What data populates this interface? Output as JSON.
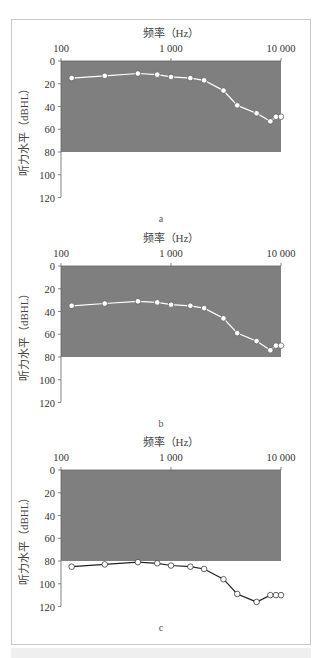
{
  "chart_data": [
    {
      "panel": "a",
      "type": "line",
      "title": "",
      "xlabel": "频率（Hz）",
      "ylabel": "听力水平（dBHL）",
      "x_scale": "log",
      "x_axis_position": "top",
      "xlim": [
        100,
        10000
      ],
      "ylim": [
        0,
        120
      ],
      "y_inverted": true,
      "x_ticks": [
        "100",
        "1 000",
        "10 000"
      ],
      "y_ticks": [
        "0",
        "20",
        "40",
        "60",
        "80",
        "100",
        "120"
      ],
      "shaded_region": {
        "y_from": 0,
        "y_to": 80,
        "color": "#7f7f7f"
      },
      "line_color": "#ffffff",
      "marker": "open-circle",
      "grid": false,
      "legend": null,
      "x": [
        125,
        250,
        500,
        750,
        1000,
        1500,
        2000,
        3000,
        4000,
        6000,
        8000,
        9000,
        10000
      ],
      "values": [
        15,
        13,
        11,
        12,
        14,
        15,
        17,
        26,
        39,
        46,
        53,
        49,
        49
      ]
    },
    {
      "panel": "b",
      "type": "line",
      "title": "",
      "xlabel": "频率（Hz）",
      "ylabel": "听力水平（dBHL）",
      "x_scale": "log",
      "x_axis_position": "top",
      "xlim": [
        100,
        10000
      ],
      "ylim": [
        0,
        120
      ],
      "y_inverted": true,
      "x_ticks": [
        "100",
        "1 000",
        "10 000"
      ],
      "y_ticks": [
        "0",
        "20",
        "40",
        "60",
        "80",
        "100",
        "120"
      ],
      "shaded_region": {
        "y_from": 0,
        "y_to": 80,
        "color": "#7f7f7f"
      },
      "line_color": "#ffffff",
      "marker": "open-circle",
      "grid": false,
      "legend": null,
      "x": [
        125,
        250,
        500,
        750,
        1000,
        1500,
        2000,
        3000,
        4000,
        6000,
        8000,
        9000,
        10000
      ],
      "values": [
        35,
        33,
        31,
        32,
        34,
        35,
        37,
        46,
        59,
        66,
        74,
        70,
        70
      ]
    },
    {
      "panel": "c",
      "type": "line",
      "title": "",
      "xlabel": "频率（Hz）",
      "ylabel": "听力水平（dBHL）",
      "x_scale": "log",
      "x_axis_position": "top",
      "xlim": [
        100,
        10000
      ],
      "ylim": [
        0,
        120
      ],
      "y_inverted": true,
      "x_ticks": [
        "100",
        "1 000",
        "10 000"
      ],
      "y_ticks": [
        "0",
        "20",
        "40",
        "60",
        "80",
        "100",
        "120"
      ],
      "shaded_region": {
        "y_from": 0,
        "y_to": 80,
        "color": "#7f7f7f"
      },
      "line_color": "#222222",
      "marker": "open-circle",
      "grid": false,
      "legend": null,
      "x": [
        125,
        250,
        500,
        750,
        1000,
        1500,
        2000,
        3000,
        4000,
        6000,
        8000,
        9000,
        10000
      ],
      "values": [
        85,
        83,
        81,
        82,
        84,
        85,
        87,
        96,
        109,
        116,
        110,
        110,
        110
      ]
    }
  ],
  "panels": [
    {
      "label": "a",
      "top": 28
    },
    {
      "label": "b",
      "top": 233
    },
    {
      "label": "c",
      "top": 437
    }
  ],
  "colors": {
    "shade": "#7f7f7f",
    "axis": "#666666",
    "frame": "#c8c8c8"
  }
}
